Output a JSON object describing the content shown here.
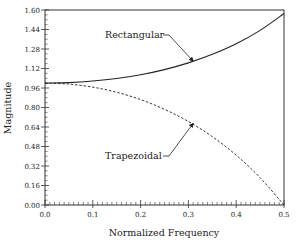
{
  "chart_data": {
    "type": "line",
    "title": "",
    "xlabel": "Normalized Frequency",
    "ylabel": "Magnitude",
    "xlim": [
      0.0,
      0.5
    ],
    "ylim": [
      0.0,
      1.6
    ],
    "xticks": [
      "0.0",
      "0.1",
      "0.2",
      "0.3",
      "0.4",
      "0.5"
    ],
    "yticks": [
      "0.00",
      "0.16",
      "0.32",
      "0.48",
      "0.64",
      "0.80",
      "0.96",
      "1.12",
      "1.28",
      "1.44",
      "1.60"
    ],
    "grid": false,
    "x": [
      0.0,
      0.05,
      0.1,
      0.15,
      0.2,
      0.25,
      0.3,
      0.35,
      0.4,
      0.45,
      0.5
    ],
    "series": [
      {
        "name": "Rectangular",
        "style": "solid",
        "values": [
          1.0,
          1.004,
          1.017,
          1.038,
          1.069,
          1.111,
          1.166,
          1.236,
          1.323,
          1.433,
          1.571
        ]
      },
      {
        "name": "Trapezoidal",
        "style": "dashed",
        "values": [
          1.0,
          0.992,
          0.967,
          0.925,
          0.865,
          0.785,
          0.685,
          0.561,
          0.409,
          0.224,
          0.0
        ]
      }
    ],
    "annotations": [
      {
        "text": "Rectangular",
        "points_to": {
          "x": 0.31,
          "y": 1.18
        }
      },
      {
        "text": "Trapezoidal",
        "points_to": {
          "x": 0.31,
          "y": 0.67
        }
      }
    ]
  }
}
